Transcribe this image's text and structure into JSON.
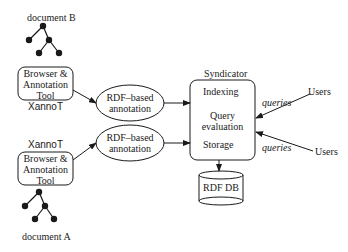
{
  "diagram": {
    "documents": {
      "top": {
        "label": "document B"
      },
      "bottom": {
        "label": "document A"
      }
    },
    "tools": {
      "top": {
        "line1": "Browser &",
        "line2": "Annotation",
        "line3": "Tool",
        "name": "XannoT"
      },
      "bottom": {
        "line1": "Browser &",
        "line2": "Annotation",
        "line3": "Tool",
        "name": "XannoT"
      }
    },
    "annotations": {
      "top": {
        "line1": "RDF–based",
        "line2": "annotation"
      },
      "bottom": {
        "line1": "RDF–based",
        "line2": "annotation"
      }
    },
    "syndicator": {
      "title": "Syndicator",
      "indexing": "Indexing",
      "query1": "Query",
      "query2": "evaluation",
      "storage": "Storage"
    },
    "database": {
      "label": "RDF DB"
    },
    "users": {
      "top": {
        "label": "Users",
        "edge": "queries"
      },
      "bottom": {
        "label": "Users",
        "edge": "queries"
      }
    }
  }
}
